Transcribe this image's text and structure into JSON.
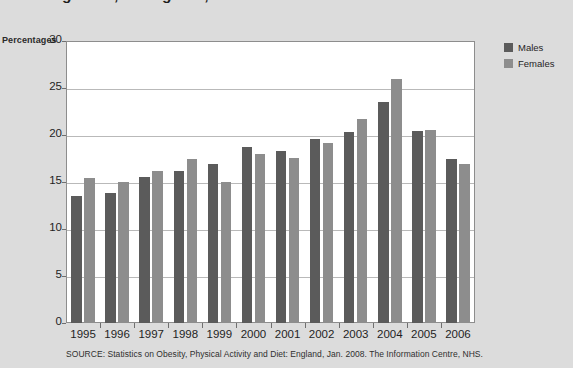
{
  "title": "gender, in England, 1995-2006",
  "axis_unit_label": "Percentages",
  "source": "SOURCE: Statistics on Obesity, Physical Activity and Diet: England, Jan. 2008. The Information Centre, NHS.",
  "legend": {
    "position": "right",
    "items": [
      {
        "label": "Males",
        "color": "#5b5b5b"
      },
      {
        "label": "Females",
        "color": "#8d8d8d"
      }
    ]
  },
  "chart_data": {
    "type": "bar",
    "title": "gender, in England, 1995-2006",
    "xlabel": "",
    "ylabel": "Percentages",
    "ylim": [
      0,
      30
    ],
    "yticks": [
      0,
      5,
      10,
      15,
      20,
      25,
      30
    ],
    "grid": true,
    "categories": [
      "1995",
      "1996",
      "1997",
      "1998",
      "1999",
      "2000",
      "2001",
      "2002",
      "2003",
      "2004",
      "2005",
      "2006"
    ],
    "series": [
      {
        "name": "Males",
        "color": "#5b5b5b",
        "values": [
          13.5,
          13.8,
          15.5,
          16.2,
          16.9,
          18.7,
          18.3,
          19.6,
          20.3,
          23.5,
          20.4,
          17.4
        ]
      },
      {
        "name": "Females",
        "color": "#8d8d8d",
        "values": [
          15.4,
          15.0,
          16.2,
          17.5,
          15.0,
          18.0,
          17.6,
          19.1,
          21.7,
          26.0,
          20.5,
          16.9
        ]
      }
    ]
  }
}
